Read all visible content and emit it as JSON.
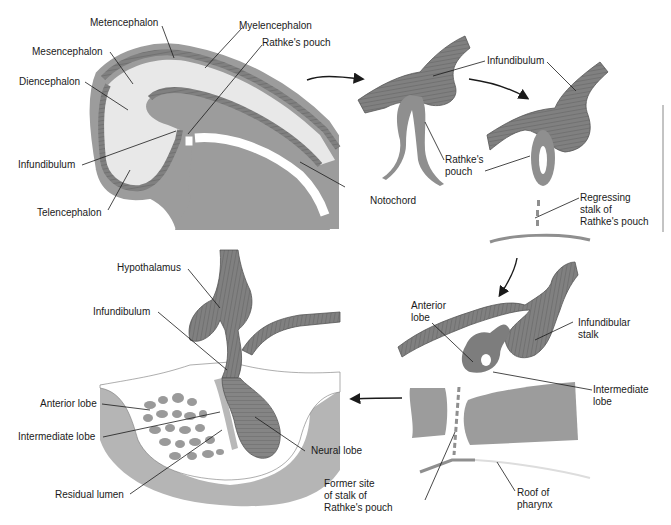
{
  "figure": {
    "colors": {
      "tissue_dark": "#7d7d7d",
      "tissue_mid": "#9a9a9a",
      "tissue_light": "#e6e6e6",
      "outline": "#555555",
      "background": "#ffffff",
      "leader_line": "#1a1a1a"
    },
    "panels": [
      {
        "id": "panel-1-embryo-head",
        "labels": {
          "metencephalon": "Metencephalon",
          "myelencephalon": "Myelencephalon",
          "rathkes_pouch": "Rathke's pouch",
          "mesencephalon": "Mesencephalon",
          "diencephalon": "Diencephalon",
          "infundibulum": "Infundibulum",
          "telencephalon": "Telencephalon",
          "notochord": "Notochord"
        }
      },
      {
        "id": "panel-2-early-pouch",
        "labels": {
          "infundibulum": "Infundibulum",
          "rathkes_pouch": "Rathke's\npouch"
        }
      },
      {
        "id": "panel-3-pouch-detaching",
        "labels": {
          "infundibulum": "Infundibulum",
          "regressing_stalk": "Regressing\nstalk of\nRathke's pouch"
        }
      },
      {
        "id": "panel-4-lobes-forming",
        "labels": {
          "anterior_lobe": "Anterior\nlobe",
          "infundibular_stalk": "Infundibular\nstalk",
          "intermediate_lobe": "Intermediate\nlobe",
          "former_site": "Former site\nof stalk of\nRathke's pouch",
          "roof_of_pharynx": "Roof of\npharynx"
        }
      },
      {
        "id": "panel-5-mature-pituitary",
        "labels": {
          "hypothalamus": "Hypothalamus",
          "infundibulum": "Infundibulum",
          "anterior_lobe": "Anterior lobe",
          "intermediate_lobe": "Intermediate lobe",
          "neural_lobe": "Neural lobe",
          "residual_lumen": "Residual lumen"
        }
      }
    ]
  }
}
